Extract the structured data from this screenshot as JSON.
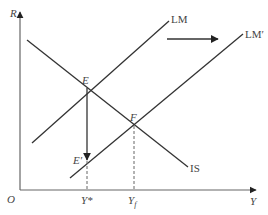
{
  "diagram": {
    "type": "IS-LM model",
    "axes": {
      "y_label": "R",
      "x_label": "Y",
      "origin_label": "O"
    },
    "curves": {
      "lm": "LM",
      "lm_shifted": "LM′",
      "is": "IS"
    },
    "points": {
      "e": "E",
      "f": "F",
      "e_prime": "E′"
    },
    "x_ticks": {
      "y_star": "Y*",
      "y_f_main": "Y",
      "y_f_sub": "f"
    },
    "colors": {
      "line": "#333333",
      "axis": "#555555",
      "dashed": "#666666"
    }
  }
}
